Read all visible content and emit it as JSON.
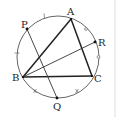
{
  "diagram": {
    "type": "circle-geometry",
    "points": [
      {
        "name": "A",
        "label": "A"
      },
      {
        "name": "B",
        "label": "B"
      },
      {
        "name": "C",
        "label": "C"
      },
      {
        "name": "P",
        "label": "P"
      },
      {
        "name": "Q",
        "label": "Q"
      },
      {
        "name": "R",
        "label": "R"
      }
    ],
    "segments": [
      {
        "from": "A",
        "to": "B",
        "style": "thick"
      },
      {
        "from": "B",
        "to": "C",
        "style": "thick"
      },
      {
        "from": "A",
        "to": "C",
        "style": "thick"
      },
      {
        "from": "P",
        "to": "Q",
        "style": "thin"
      },
      {
        "from": "B",
        "to": "R",
        "style": "thin"
      }
    ],
    "arc_marks": [
      {
        "arc": "PA",
        "mark": "tick"
      },
      {
        "arc": "AR",
        "mark": "circle"
      },
      {
        "arc": "RC",
        "mark": "circle"
      },
      {
        "arc": "PB",
        "mark": "tick"
      },
      {
        "arc": "BQ",
        "mark": "cross"
      },
      {
        "arc": "QC",
        "mark": "cross"
      }
    ]
  }
}
